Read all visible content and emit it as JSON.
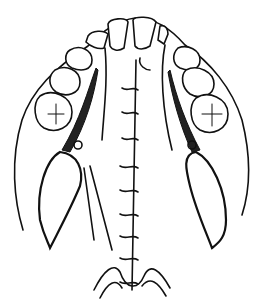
{
  "figure": {
    "colors": {
      "line": "#111111",
      "background": "#ffffff"
    },
    "suture_count": 10
  }
}
